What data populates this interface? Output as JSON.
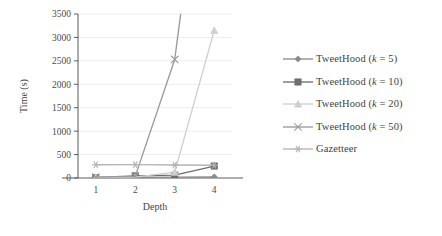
{
  "chart_data": {
    "type": "line",
    "title": "",
    "xlabel": "Depth",
    "ylabel": "Time (s)",
    "categories": [
      "1",
      "2",
      "3",
      "4"
    ],
    "x": [
      1,
      2,
      3,
      4
    ],
    "xlim": [
      0.55,
      4.45
    ],
    "ylim": [
      0,
      3500
    ],
    "yticks": [
      0,
      500,
      1000,
      1500,
      2000,
      2500,
      3000,
      3500
    ],
    "ytick_labels": [
      "0",
      "500",
      "1000",
      "1500",
      "2000",
      "2500",
      "3000",
      "3500"
    ],
    "grid": "horizontal",
    "legend_position": "right",
    "clipped_note": "TweetHood (k = 50) and TweetHood (k = 20) exceed the 3500 s axis maximum beyond depth 3 and depth 4 respectively",
    "series": [
      {
        "name": "TweetHood (k = 5)",
        "label_prefix": "TweetHood (",
        "label_var": "k",
        "label_suffix": " = 5)",
        "marker": "diamond",
        "color": "#8c8c8c",
        "values": [
          5,
          12,
          18,
          22
        ]
      },
      {
        "name": "TweetHood (k = 10)",
        "label_prefix": "TweetHood (",
        "label_var": "k",
        "label_suffix": " = 10)",
        "marker": "square",
        "color": "#6e6e6e",
        "values": [
          10,
          45,
          60,
          255
        ]
      },
      {
        "name": "TweetHood (k = 20)",
        "label_prefix": "TweetHood (",
        "label_var": "k",
        "label_suffix": " = 20)",
        "marker": "triangle",
        "color": "#cfcfcf",
        "values": [
          15,
          20,
          125,
          3150
        ]
      },
      {
        "name": "TweetHood (k = 50)",
        "label_prefix": "TweetHood (",
        "label_var": "k",
        "label_suffix": " = 50)",
        "marker": "cross",
        "color": "#9a9a9a",
        "values": [
          20,
          35,
          2530,
          9000
        ]
      },
      {
        "name": "Gazetteer",
        "label_prefix": "Gazetteer",
        "label_var": "",
        "label_suffix": "",
        "marker": "star",
        "color": "#b5b5b5",
        "values": [
          282,
          285,
          278,
          272
        ]
      }
    ]
  },
  "axes": {
    "y_title": "Time (s)",
    "x_title": "Depth"
  },
  "legend": {
    "items": [
      {
        "label": "TweetHood (k = 5)"
      },
      {
        "label": "TweetHood (k = 10)"
      },
      {
        "label": "TweetHood (k = 20)"
      },
      {
        "label": "TweetHood (k = 50)"
      },
      {
        "label": "Gazetteer"
      }
    ]
  },
  "colors": {
    "axis": "#5a5a5a",
    "grid": "#ededed",
    "text": "#3f3f3f",
    "background": "#ffffff"
  }
}
